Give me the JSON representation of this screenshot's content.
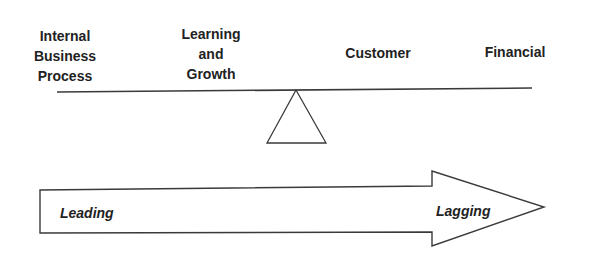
{
  "diagram": {
    "type": "balance-scale-with-arrow",
    "categories": [
      {
        "key": "internal_business_process",
        "lines": [
          "Internal",
          "Business",
          "Process"
        ]
      },
      {
        "key": "learning_and_growth",
        "lines": [
          "Learning",
          "and",
          "Growth"
        ]
      },
      {
        "key": "customer",
        "lines": [
          "Customer"
        ]
      },
      {
        "key": "financial",
        "lines": [
          "Financial"
        ]
      }
    ],
    "arrow": {
      "direction": "right",
      "start_label": "Leading",
      "end_label": "Lagging"
    },
    "colors": {
      "stroke": "#3a3a3a",
      "text": "#222222",
      "background": "#ffffff"
    }
  }
}
